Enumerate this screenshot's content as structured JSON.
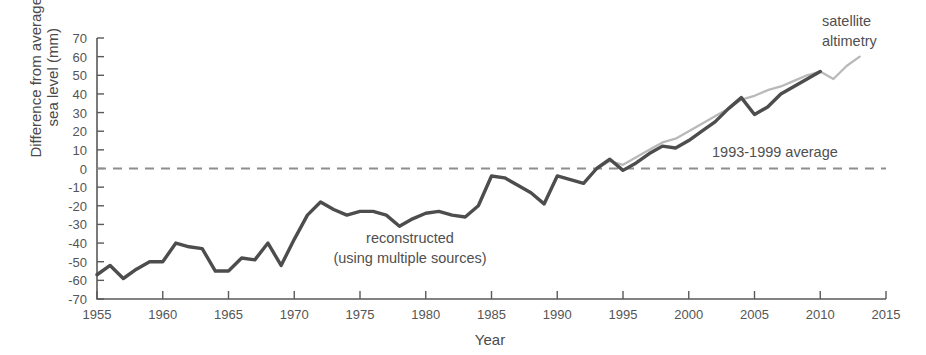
{
  "chart_data": {
    "type": "line",
    "title": "",
    "xlabel": "Year",
    "ylabel": "Difference from average sea level (mm)",
    "ylabel_line1": "Difference from average",
    "ylabel_line2": "sea level (mm)",
    "xlim": [
      1955,
      2015
    ],
    "ylim": [
      -70,
      70
    ],
    "ytick_step": 10,
    "xtick_step": 5,
    "grid": false,
    "legend_position": "inline-annotations",
    "xticks": [
      1955,
      1960,
      1965,
      1970,
      1975,
      1980,
      1985,
      1990,
      1995,
      2000,
      2005,
      2010,
      2015
    ],
    "yticks": [
      70,
      60,
      50,
      40,
      30,
      20,
      10,
      0,
      -10,
      -20,
      -30,
      -40,
      -50,
      -60,
      -70
    ],
    "baseline": {
      "value": 0,
      "label": "1993-1999 average",
      "style": "dashed",
      "color": "#8e8e8e"
    },
    "series": [
      {
        "name": "reconstructed",
        "annotation_line1": "reconstructed",
        "annotation_line2": "(using multiple sources)",
        "color": "#4d4d4d",
        "x": [
          1955,
          1956,
          1957,
          1958,
          1959,
          1960,
          1961,
          1962,
          1963,
          1964,
          1965,
          1966,
          1967,
          1968,
          1969,
          1970,
          1971,
          1972,
          1973,
          1974,
          1975,
          1976,
          1977,
          1978,
          1979,
          1980,
          1981,
          1982,
          1983,
          1984,
          1985,
          1986,
          1987,
          1988,
          1989,
          1990,
          1991,
          1992,
          1993,
          1994,
          1995,
          1996,
          1997,
          1998,
          1999,
          2000,
          2001,
          2002,
          2003,
          2004,
          2005,
          2006,
          2007,
          2008,
          2009,
          2010
        ],
        "values": [
          -57,
          -52,
          -59,
          -54,
          -50,
          -50,
          -40,
          -42,
          -43,
          -55,
          -55,
          -48,
          -49,
          -40,
          -52,
          -38,
          -25,
          -18,
          -22,
          -25,
          -23,
          -23,
          -25,
          -31,
          -27,
          -24,
          -23,
          -25,
          -26,
          -20,
          -4,
          -5,
          -9,
          -13,
          -19,
          -4,
          -6,
          -8,
          0,
          5,
          -1,
          3,
          8,
          12,
          11,
          15,
          20,
          25,
          32,
          38,
          29,
          33,
          40,
          44,
          48,
          52
        ]
      },
      {
        "name": "satellite altimetry",
        "annotation_line1": "satellite",
        "annotation_line2": "altimetry",
        "color": "#b9b9b9",
        "x": [
          1993,
          1994,
          1995,
          1996,
          1997,
          1998,
          1999,
          2000,
          2001,
          2002,
          2003,
          2004,
          2005,
          2006,
          2007,
          2008,
          2009,
          2010,
          2011,
          2012,
          2013
        ],
        "values": [
          0,
          4,
          2,
          6,
          10,
          14,
          16,
          20,
          24,
          28,
          32,
          37,
          39,
          42,
          44,
          47,
          50,
          52,
          48,
          55,
          60
        ]
      }
    ]
  },
  "annotations": {
    "satellite_line1": "satellite",
    "satellite_line2": "altimetry",
    "reconstructed_line1": "reconstructed",
    "reconstructed_line2": "(using multiple sources)",
    "baseline_label": "1993-1999 average"
  },
  "axes": {
    "x_title": "Year",
    "y_title_line1": "Difference from average",
    "y_title_line2": "sea level (mm)"
  },
  "colors": {
    "reconstructed": "#4d4d4d",
    "satellite": "#b9b9b9",
    "baseline": "#8e8e8e",
    "axis": "#5a5a5a",
    "text": "#4f4f4f",
    "background": "#ffffff"
  }
}
